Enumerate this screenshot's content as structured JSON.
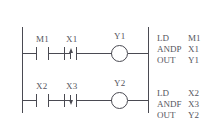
{
  "diagram": {
    "type": "plc-ladder-logic",
    "rails": {
      "left": "power-rail-left",
      "right": "power-rail-right"
    },
    "rungs": [
      {
        "id": "rung-1",
        "elements": [
          {
            "kind": "contact-no",
            "label": "M1",
            "symbol": "normally-open-contact"
          },
          {
            "kind": "contact-rising",
            "label": "X1",
            "symbol": "rising-edge-contact"
          },
          {
            "kind": "coil",
            "label": "Y1",
            "symbol": "output-coil"
          }
        ]
      },
      {
        "id": "rung-2",
        "elements": [
          {
            "kind": "contact-no",
            "label": "X2",
            "symbol": "normally-open-contact"
          },
          {
            "kind": "contact-falling",
            "label": "X3",
            "symbol": "falling-edge-contact"
          },
          {
            "kind": "coil",
            "label": "Y2",
            "symbol": "output-coil"
          }
        ]
      }
    ]
  },
  "instruction_list": [
    {
      "id": "il-block-1",
      "lines": [
        {
          "op": "LD",
          "arg": "M1"
        },
        {
          "op": "ANDP",
          "arg": "X1"
        },
        {
          "op": "OUT",
          "arg": "Y1"
        }
      ]
    },
    {
      "id": "il-block-2",
      "lines": [
        {
          "op": "LD",
          "arg": "X2"
        },
        {
          "op": "ANDF",
          "arg": "X3"
        },
        {
          "op": "OUT",
          "arg": "Y2"
        }
      ]
    }
  ],
  "colors": {
    "line": "#4a4a52",
    "text": "#55555d",
    "background": "#ffffff"
  }
}
